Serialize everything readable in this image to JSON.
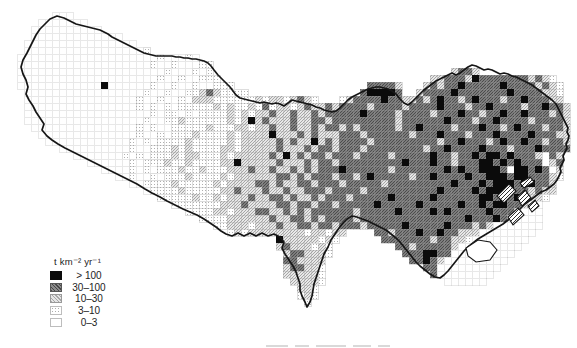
{
  "figure": {
    "type": "gridded-choropleth-map",
    "background": "#ffffff",
    "boundary_color": "#161616"
  },
  "legend": {
    "title": "t km⁻² yr⁻¹",
    "items": [
      {
        "label": "> 100",
        "category": "cat4",
        "fill": "#0b0b0b"
      },
      {
        "label": "30–100",
        "category": "cat3",
        "fill": "#6b6b6b"
      },
      {
        "label": "10–30",
        "category": "cat2",
        "fill": "#c6c6c6"
      },
      {
        "label": "3–10",
        "category": "cat1",
        "fill": "#e9e9e9"
      },
      {
        "label": "0–3",
        "category": "cat0",
        "fill": "#ffffff"
      }
    ]
  },
  "map": {
    "grid": {
      "cell_px": 7,
      "origin_x": 10,
      "origin_y": 12,
      "cols": 80,
      "rows": 42,
      "encoding": {
        "0": "0–3",
        "1": "3–10",
        "2": "10–30",
        "3": "30–100",
        "4": "> 100"
      },
      "rows_runs": [
        [
          [
            6,
            "000"
          ]
        ],
        [
          [
            4,
            "0000000"
          ]
        ],
        [
          [
            3,
            "0000000000"
          ]
        ],
        [
          [
            3,
            "0000000000000"
          ]
        ],
        [
          [
            2,
            "0000000000000000"
          ]
        ],
        [
          [
            2,
            "000000000000000001"
          ]
        ],
        [
          [
            1,
            "00000000000000000000100010"
          ]
        ],
        [
          [
            1,
            "0000000000000000000100100011"
          ]
        ],
        [
          [
            1,
            "0000000000000000000001000101"
          ],
          [
            63,
            "2332"
          ]
        ],
        [
          [
            1,
            "00000000000000000000100100111"
          ],
          [
            60,
            "223332433333332321"
          ]
        ],
        [
          [
            1,
            "0000000000004000000100100100111"
          ],
          [
            51,
            "33332"
          ],
          [
            59,
            "23233433333433332321"
          ]
        ],
        [
          [
            2,
            "00000000000000000100100112321111"
          ],
          [
            50,
            "344443"
          ],
          [
            58,
            "233334333333343333221"
          ]
        ],
        [
          [
            2,
            "000000000000000010010010222111111212212321"
          ],
          [
            47,
            "12333343322323433234333233433322"
          ]
        ],
        [
          [
            2,
            "000000000000000010101011111212112131221232232333323333233334333233433332334332"
          ]
        ],
        [
          [
            2,
            "000000000000000000101101011112121223223223233333433332333323334332334334333232"
          ]
        ],
        [
          [
            2,
            "000000000000000001001121111112124232223223323333333332333333433323343333233332"
          ]
        ],
        [
          [
            3,
            "00000000000000010100111112111221223223223233232333332334333323334332343332332"
          ]
        ],
        [
          [
            4,
            "0000000000000010010111211112122224222323222333233333323334333233343333433322"
          ]
        ],
        [
          [
            5,
            "000000000000101011112111112122222323224232333323333333332334333234334332332"
          ]
        ],
        [
          [
            7,
            "0000000000100111212111122122222322232332333233333333233433334333233343333"
          ]
        ],
        [
          [
            9,
            "0000000101011121221112122222324232332333233332333334332334344343332 32"
          ]
        ],
        [
          [
            11,
            "00000010111211211112242222232223233233333333343334332333443434333 23"
          ]
        ],
        [
          [
            13,
            "0000101011121121112223223223232333433333323333333434334443 44343 2"
          ]
        ],
        [
          [
            15,
            "0010010111211112122222233232333233234333332334333343344434433321"
          ]
        ],
        [
          [
            17,
            "0011112111112122223323223323332333332333333333433343444344332"
          ]
        ],
        [
          [
            19,
            "01111211111223222322322333233332333333333343333434444332322"
          ]
        ],
        [
          [
            21,
            "11111211212223223323223233323333343333343333334434343221"
          ]
        ],
        [
          [
            23,
            "11111112223222233233233233333433333433333433434433200"
          ]
        ],
        [
          [
            25,
            "111122122233223232333333233333433334343333343332000"
          ]
        ],
        [
          [
            27,
            "1111222222322332323333233333333333333343334320000"
          ]
        ],
        [
          [
            29,
            "11222122232233233233323333343333343332320000000"
          ]
        ],
        [
          [
            31,
            "12122222222122122"
          ],
          [
            52,
            "33233343343322200000000"
          ]
        ],
        [
          [
            38,
            "422222121"
          ],
          [
            53,
            "333333323322100000000"
          ]
        ],
        [
          [
            38,
            "23222121"
          ],
          [
            55,
            "332333332000000000"
          ]
        ],
        [
          [
            39,
            "2332221"
          ],
          [
            56,
            "3334433000000000"
          ]
        ],
        [
          [
            39,
            "332222"
          ],
          [
            57,
            "33432000000000"
          ]
        ],
        [
          [
            39,
            "233221"
          ],
          [
            59,
            "33000000000"
          ]
        ],
        [
          [
            39,
            "222221"
          ],
          [
            60,
            "300000000"
          ]
        ],
        [
          [
            40,
            "22221"
          ],
          [
            62,
            "000000"
          ]
        ],
        [
          [
            41,
            "221"
          ]
        ],
        [
          [
            41,
            "121"
          ]
        ],
        [
          [
            42,
            "1"
          ]
        ]
      ]
    }
  }
}
